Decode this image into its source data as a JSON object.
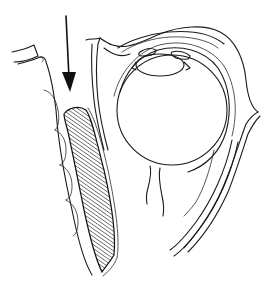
{
  "figure": {
    "type": "anatomical-line-drawing",
    "view": "sagittal section of orbit and eyelid region",
    "background": "#ffffff",
    "line_color": "#1a1a1a",
    "elements": {
      "arrow": {
        "direction": "down",
        "color": "#111111"
      },
      "hatched_region": {
        "pattern": "diagonal hatching",
        "color": "#222222"
      },
      "globe": {
        "shape": "circle"
      },
      "lens": {
        "shape": "ellipse"
      }
    }
  }
}
